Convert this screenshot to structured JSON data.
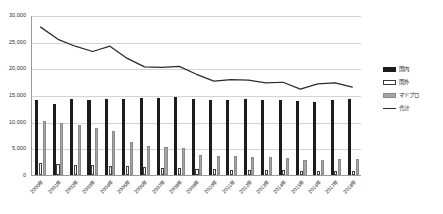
{
  "chart_data": {
    "type": "bar",
    "title": "",
    "subtitle": "",
    "xlabel": "",
    "ylabel": "",
    "ylim": [
      0,
      30000
    ],
    "ytick_values": [
      0,
      5000,
      10000,
      15000,
      20000,
      25000,
      30000
    ],
    "ytick_labels": [
      "0",
      "5,000",
      "10,000",
      "15,000",
      "20,000",
      "25,000",
      "30,000"
    ],
    "grid": true,
    "legend_position": "right",
    "categories": [
      "2000年",
      "2001年",
      "2002年",
      "2003年",
      "2004年",
      "2005年",
      "2006年",
      "2007年",
      "2008年",
      "2009年",
      "2010年",
      "2011年",
      "2012年",
      "2013年",
      "2014年",
      "2015年",
      "2016年",
      "2017年",
      "2018年"
    ],
    "series": [
      {
        "name": "国内",
        "type": "bar",
        "color": "#1c1c1c",
        "values": [
          14100,
          13300,
          14200,
          14000,
          14200,
          14300,
          14500,
          14400,
          14600,
          14200,
          14000,
          14100,
          14200,
          14100,
          14000,
          13800,
          13600,
          14100,
          14200
        ]
      },
      {
        "name": "国外",
        "type": "bar",
        "color": "#ffffff",
        "values": [
          2300,
          2000,
          1900,
          1800,
          1700,
          1600,
          1500,
          1400,
          1300,
          1200,
          1100,
          1000,
          950,
          900,
          850,
          800,
          780,
          760,
          740
        ]
      },
      {
        "name": "マドプロ",
        "type": "bar",
        "color": "#a6a6a6",
        "values": [
          10100,
          9700,
          9300,
          8900,
          8200,
          6200,
          5400,
          5200,
          5000,
          3800,
          3600,
          3500,
          3400,
          3300,
          3200,
          2900,
          2800,
          3000,
          3000
        ]
      },
      {
        "name": "合計",
        "type": "line",
        "color": "#2b2b2b",
        "values": [
          27900,
          25600,
          24300,
          23300,
          24300,
          22000,
          20400,
          20300,
          20500,
          19000,
          17700,
          18000,
          17900,
          17400,
          17500,
          16200,
          17200,
          17400,
          16600
        ]
      }
    ],
    "legend_entries": [
      {
        "label": "国内",
        "marker": "bar-black-swatch"
      },
      {
        "label": "国外",
        "marker": "bar-white-swatch"
      },
      {
        "label": "マドプロ",
        "marker": "bar-gray-swatch"
      },
      {
        "label": "合計",
        "marker": "line-swatch"
      }
    ]
  }
}
